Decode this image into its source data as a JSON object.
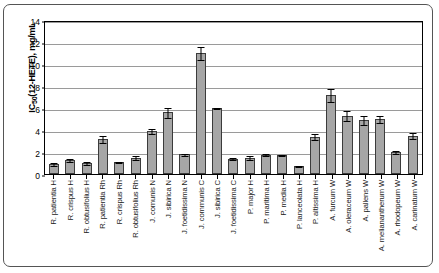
{
  "chart_data": {
    "type": "bar",
    "title": "",
    "subtitle": "",
    "xlabel": "",
    "ylabel": "IC50(12-HETE), mg/mL",
    "ylabel_main": "IC",
    "ylabel_sub": "50",
    "ylabel_rest": "(12-HETE), mg/mL",
    "ylim": [
      0,
      14
    ],
    "ytick_step": 2,
    "yticks": [
      0,
      2,
      4,
      6,
      8,
      10,
      12,
      14
    ],
    "grid": true,
    "grid_orientation": "horizontal",
    "legend": null,
    "legend_position": "none",
    "bar_color": "#a6a6a6",
    "bar_edge_color": "#3b3b3b",
    "error_bar_color": "#000000",
    "gridline_color": "#9a9a9a",
    "axis_color": "#000000",
    "background_color": "#ffffff",
    "categories": [
      "R. patientia H",
      "R. crispus H",
      "R. obtusifolius H",
      "R. patientia Rh",
      "R. crispus Rh",
      "R. obtusifolius Rh",
      "J. comunis N",
      "J. sibirica N",
      "J. foetidissima N",
      "J. communis C",
      "J. sibirica C",
      "J. foetidissima C",
      "P. major H",
      "P. maritima H",
      "P. media H",
      "P. lanceolata H",
      "P. altissima H",
      "A. furcum W",
      "A. oleraceum W",
      "A. pallens W",
      "A. melianantherum W",
      "A. rhodopeum W",
      "A. carinatum W"
    ],
    "values": [
      0.9,
      1.3,
      1.0,
      3.2,
      1.1,
      1.5,
      3.9,
      5.6,
      1.8,
      11.0,
      6.0,
      1.4,
      1.5,
      1.75,
      1.7,
      0.7,
      3.4,
      7.2,
      5.3,
      4.9,
      5.0,
      2.0,
      3.5
    ],
    "errors": [
      0.15,
      0.2,
      0.15,
      0.35,
      0.12,
      0.2,
      0.3,
      0.5,
      0.12,
      0.6,
      0.12,
      0.15,
      0.2,
      0.15,
      0.1,
      0.08,
      0.3,
      0.65,
      0.5,
      0.45,
      0.4,
      0.2,
      0.3
    ]
  }
}
